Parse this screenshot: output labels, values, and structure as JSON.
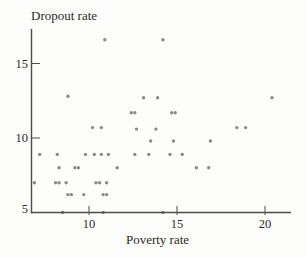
{
  "figure": {
    "kind": "scatter plot",
    "background": "#fdfdfc"
  },
  "chart_data": {
    "type": "scatter",
    "title": "",
    "xlabel": "Poverty rate",
    "ylabel": "Dropout rate",
    "xlim": [
      6.7,
      21.5
    ],
    "ylim": [
      5,
      17.3
    ],
    "x_ticks": [
      10,
      15,
      20
    ],
    "y_ticks": [
      5,
      10,
      15
    ],
    "grid": false,
    "legend": null,
    "point_color": "#8a8a8a",
    "axis_color": "#4c4c4c",
    "text_color": "#2a2a2a",
    "points": [
      {
        "x": 10.9,
        "y": 16.6
      },
      {
        "x": 14.2,
        "y": 16.6
      },
      {
        "x": 8.8,
        "y": 12.8
      },
      {
        "x": 13.1,
        "y": 12.7
      },
      {
        "x": 13.9,
        "y": 12.7
      },
      {
        "x": 20.4,
        "y": 12.7
      },
      {
        "x": 12.4,
        "y": 11.7
      },
      {
        "x": 12.6,
        "y": 11.7
      },
      {
        "x": 14.7,
        "y": 11.7
      },
      {
        "x": 14.9,
        "y": 11.7
      },
      {
        "x": 10.2,
        "y": 10.7
      },
      {
        "x": 10.7,
        "y": 10.7
      },
      {
        "x": 12.7,
        "y": 10.6
      },
      {
        "x": 13.8,
        "y": 10.6
      },
      {
        "x": 18.4,
        "y": 10.7
      },
      {
        "x": 18.9,
        "y": 10.7
      },
      {
        "x": 13.5,
        "y": 9.8
      },
      {
        "x": 14.8,
        "y": 9.8
      },
      {
        "x": 16.9,
        "y": 9.8
      },
      {
        "x": 7.2,
        "y": 8.9
      },
      {
        "x": 8.2,
        "y": 8.9
      },
      {
        "x": 9.8,
        "y": 8.9
      },
      {
        "x": 10.3,
        "y": 8.9
      },
      {
        "x": 10.7,
        "y": 8.9
      },
      {
        "x": 11.1,
        "y": 8.9
      },
      {
        "x": 12.6,
        "y": 8.9
      },
      {
        "x": 13.4,
        "y": 8.9
      },
      {
        "x": 14.6,
        "y": 8.9
      },
      {
        "x": 15.3,
        "y": 8.9
      },
      {
        "x": 8.3,
        "y": 8.0
      },
      {
        "x": 9.2,
        "y": 8.0
      },
      {
        "x": 9.4,
        "y": 8.0
      },
      {
        "x": 11.6,
        "y": 8.0
      },
      {
        "x": 16.1,
        "y": 8.0
      },
      {
        "x": 16.8,
        "y": 8.0
      },
      {
        "x": 6.9,
        "y": 7.0
      },
      {
        "x": 8.1,
        "y": 7.0
      },
      {
        "x": 8.3,
        "y": 7.0
      },
      {
        "x": 8.7,
        "y": 7.0
      },
      {
        "x": 10.4,
        "y": 7.0
      },
      {
        "x": 10.6,
        "y": 7.0
      },
      {
        "x": 11.0,
        "y": 7.0
      },
      {
        "x": 8.8,
        "y": 6.2
      },
      {
        "x": 9.0,
        "y": 6.2
      },
      {
        "x": 9.7,
        "y": 6.2
      },
      {
        "x": 10.8,
        "y": 6.2
      },
      {
        "x": 11.0,
        "y": 6.2
      },
      {
        "x": 8.5,
        "y": 5.0
      },
      {
        "x": 10.8,
        "y": 5.0
      },
      {
        "x": 14.2,
        "y": 5.0
      }
    ]
  }
}
